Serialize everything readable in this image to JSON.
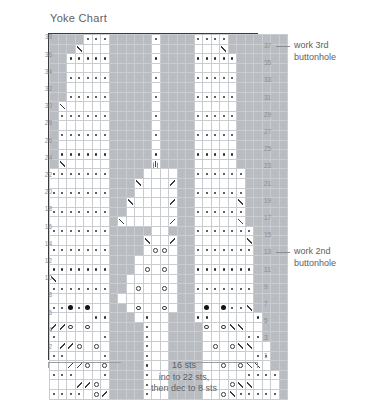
{
  "title": "Yoke Chart",
  "colors": {
    "cell_gray": "#b9bcc0",
    "cell_white": "#ffffff",
    "grid_line": "#c9ccd0",
    "border": "#3a3a3a",
    "text": "#5d6166",
    "label": "#8b8f94",
    "symbol": "#2b2b2b"
  },
  "grid": {
    "columns": 28,
    "rows": 38,
    "left_labels": [
      38,
      36,
      34,
      32,
      30,
      28,
      26,
      24,
      22,
      20,
      18,
      16,
      14,
      12,
      10,
      8,
      6,
      4,
      2
    ],
    "right_labels": [
      37,
      35,
      33,
      31,
      29,
      27,
      25,
      23,
      21,
      19,
      17,
      15,
      13,
      11,
      9,
      7,
      5,
      3,
      1
    ]
  },
  "annotations": [
    {
      "id": "anno-row-37",
      "row": 37,
      "line1": "work 3rd",
      "line2": "buttonhole"
    },
    {
      "id": "anno-row-13",
      "row": 13,
      "line1": "work 2nd",
      "line2": "buttonhole"
    }
  ],
  "caption": {
    "line1": "16 sts",
    "line2": "inc to 22 sts,",
    "line3": "then dec to 8 sts"
  },
  "legend_symbols": {
    "dot": "purl-dot",
    "bobble": "filled-bobble",
    "yo": "yarn-over-circle",
    "k2tog": "k2tog-right-slant",
    "ssk": "ssk-left-slant",
    "cdd": "centered-double-decrease",
    "bar": "horizontal-bar"
  },
  "chart_data": {
    "type": "heatmap",
    "title": "Yoke Chart",
    "xlabel": "",
    "ylabel": "",
    "columns": 28,
    "rows": 38,
    "legend": [
      "gray = background stitch",
      "white = contrast stitch"
    ],
    "cell_codes": "g=gray w=white; symbol suffix: .d dot, .b bobble, .o yarnover, .k k2tog, .s ssk, .c cdd, .h bar",
    "matrix": [
      [
        "g",
        "g",
        "g",
        "g",
        "w.d",
        "w.d",
        "w.d",
        "g",
        "g",
        "g",
        "g",
        "g",
        "w.d",
        "g",
        "g",
        "g",
        "g",
        "w.d",
        "w.d",
        "w.d",
        "w.d",
        "g",
        "g",
        "g",
        "g",
        "g",
        "g",
        "g"
      ],
      [
        "g",
        "g",
        "g",
        "w.k",
        "w",
        "w",
        "w",
        "g",
        "g",
        "g",
        "g",
        "g",
        "w",
        "g",
        "g",
        "g",
        "g",
        "w",
        "w",
        "w",
        "w.k",
        "g",
        "g",
        "g",
        "g",
        "g",
        "g",
        "g"
      ],
      [
        "g",
        "g",
        "w.d",
        "w.d",
        "w.d",
        "w.d",
        "w.d",
        "g",
        "g",
        "g",
        "g",
        "g",
        "w.d",
        "g",
        "g",
        "g",
        "g",
        "w.d",
        "w.d",
        "w.d",
        "w.d",
        "w.d",
        "g",
        "g",
        "g",
        "g",
        "g",
        "g"
      ],
      [
        "g",
        "g",
        "w",
        "w",
        "w",
        "w",
        "w",
        "g",
        "g",
        "g",
        "g",
        "g",
        "w",
        "g",
        "g",
        "g",
        "g",
        "w",
        "w",
        "w",
        "w",
        "w",
        "g",
        "g",
        "g",
        "g",
        "g",
        "g"
      ],
      [
        "g",
        "g",
        "w.d",
        "w.d",
        "w.d",
        "w.d",
        "w.d",
        "g",
        "g",
        "g",
        "g",
        "g",
        "w.d",
        "g",
        "g",
        "g",
        "g",
        "w.d",
        "w.d",
        "w.d",
        "w.d",
        "w.d",
        "g",
        "g",
        "g",
        "g",
        "g",
        "g"
      ],
      [
        "g",
        "g",
        "w",
        "w",
        "w",
        "w",
        "w",
        "g",
        "g",
        "g",
        "g",
        "g",
        "w",
        "g",
        "g",
        "g",
        "g",
        "w",
        "w",
        "w",
        "w",
        "w",
        "g",
        "g",
        "g",
        "g",
        "g",
        "g"
      ],
      [
        "g",
        "g",
        "w.d",
        "w.d",
        "w.d",
        "w.d",
        "w.d",
        "g",
        "g",
        "g",
        "g",
        "g",
        "w.d",
        "g",
        "g",
        "g",
        "g",
        "w.d",
        "w.d",
        "w.d",
        "w.d",
        "w.d",
        "g",
        "g",
        "g",
        "g",
        "g",
        "g"
      ],
      [
        "g",
        "w.k",
        "w",
        "w",
        "w",
        "w",
        "w",
        "g",
        "g",
        "g",
        "g",
        "g",
        "w",
        "g",
        "g",
        "g",
        "g",
        "w",
        "w",
        "w",
        "w",
        "w",
        "g",
        "g",
        "g",
        "g",
        "g",
        "g"
      ],
      [
        "g",
        "w.d",
        "w.d",
        "w.d",
        "w.d",
        "w.d",
        "w.d",
        "g",
        "g",
        "g",
        "g",
        "g",
        "w.d",
        "g",
        "g",
        "g",
        "g",
        "w.d",
        "w.d",
        "w.d",
        "w.d",
        "w.d",
        "g",
        "g",
        "g",
        "g",
        "g",
        "g"
      ],
      [
        "g",
        "w",
        "w",
        "w",
        "w",
        "w",
        "w",
        "g",
        "g",
        "g",
        "g",
        "g",
        "w",
        "g",
        "g",
        "g",
        "g",
        "w",
        "w",
        "w",
        "w",
        "w",
        "g",
        "g",
        "g",
        "g",
        "g",
        "g"
      ],
      [
        "g",
        "w.d",
        "w.d",
        "w.d",
        "w.d",
        "w.d",
        "w.d",
        "g",
        "g",
        "g",
        "g",
        "g",
        "w.d",
        "g",
        "g",
        "g",
        "g",
        "w.d",
        "w.d",
        "w.d",
        "w.d",
        "w.d",
        "g",
        "g",
        "g",
        "g",
        "g",
        "g"
      ],
      [
        "g",
        "w",
        "w",
        "w",
        "w",
        "w",
        "w",
        "g",
        "g",
        "g",
        "g",
        "g",
        "w",
        "g",
        "g",
        "g",
        "g",
        "w",
        "w",
        "w",
        "w",
        "w",
        "g",
        "g",
        "g",
        "g",
        "g",
        "g"
      ],
      [
        "g",
        "w.d",
        "w.d",
        "w.d",
        "w.d",
        "w.d",
        "w.d",
        "g",
        "g",
        "g",
        "g",
        "g",
        "w.d",
        "g",
        "g",
        "g",
        "g",
        "w.d",
        "w.d",
        "w.d",
        "w.d",
        "w.d",
        "g",
        "g",
        "g",
        "g",
        "g",
        "g"
      ],
      [
        "g",
        "w.k",
        "w",
        "w",
        "w",
        "w",
        "w",
        "g",
        "g",
        "g",
        "g",
        "g",
        "w.c",
        "g",
        "g",
        "g",
        "g",
        "w",
        "w",
        "w",
        "w",
        "w",
        "g",
        "g",
        "g",
        "g",
        "g",
        "g"
      ],
      [
        "w.d",
        "w.d",
        "w.d",
        "w.d",
        "w.d",
        "w.d",
        "w.d",
        "g",
        "g",
        "g",
        "g",
        "w",
        "w",
        "w",
        "w",
        "g",
        "g",
        "w.d",
        "w.d",
        "w.d",
        "w.d",
        "w.d",
        "w.d",
        "g",
        "g",
        "g",
        "g",
        "g"
      ],
      [
        "w",
        "w",
        "w",
        "w",
        "w",
        "w",
        "w",
        "g",
        "g",
        "g",
        "w.k",
        "w",
        "w",
        "w",
        "w.s",
        "g",
        "g",
        "w",
        "w",
        "w",
        "w",
        "w",
        "w",
        "g",
        "g",
        "g",
        "g",
        "g"
      ],
      [
        "w.d",
        "w.d",
        "w.d",
        "w.d",
        "w.d",
        "w.d",
        "w.d",
        "g",
        "g",
        "g",
        "w",
        "w",
        "w",
        "w",
        "w",
        "g",
        "g",
        "w.d",
        "w.d",
        "w.d",
        "w.d",
        "w.d",
        "w.d",
        "g",
        "g",
        "g",
        "g",
        "g"
      ],
      [
        "w",
        "w",
        "w",
        "w",
        "w",
        "w",
        "w",
        "g",
        "g",
        "w.k",
        "w",
        "w",
        "w",
        "w",
        "w.s",
        "g",
        "g",
        "w",
        "w",
        "w",
        "w",
        "w",
        "w.k",
        "g",
        "g",
        "g",
        "g",
        "g"
      ],
      [
        "w.d",
        "w.d",
        "w.d",
        "w.d",
        "w.d",
        "w.d",
        "w.d",
        "g",
        "g",
        "w",
        "w",
        "w",
        "w",
        "w",
        "w",
        "g",
        "g",
        "w.d",
        "w.d",
        "w.d",
        "w.d",
        "w.d",
        "w.d",
        "g",
        "g",
        "g",
        "g",
        "g"
      ],
      [
        "w",
        "w",
        "w",
        "w",
        "w",
        "w",
        "w",
        "g",
        "w.k",
        "w",
        "w",
        "w",
        "w",
        "w",
        "w.s",
        "g",
        "g",
        "w",
        "w",
        "w",
        "w",
        "w",
        "w.k",
        "g",
        "g",
        "g",
        "g",
        "g"
      ],
      [
        "w.d",
        "w.d",
        "w.d",
        "w.d",
        "w.d",
        "w.d",
        "w.d",
        "g",
        "g",
        "g",
        "g",
        "g",
        "w",
        "w",
        "g",
        "g",
        "g",
        "w.d",
        "w.d",
        "w.d",
        "w.d",
        "w.d",
        "w.d",
        "w.d",
        "g",
        "g",
        "g",
        "g"
      ],
      [
        "w",
        "w",
        "w",
        "w",
        "w",
        "w",
        "w",
        "g",
        "g",
        "g",
        "g",
        "w.k",
        "w",
        "w",
        "w.s",
        "g",
        "g",
        "w",
        "w",
        "w",
        "w",
        "w",
        "w",
        "w.k",
        "g",
        "g",
        "g",
        "g"
      ],
      [
        "w.d",
        "w.d",
        "w.d",
        "w.d",
        "w.d",
        "w.d",
        "w.d",
        "g",
        "g",
        "g",
        "g",
        "w",
        "w.o",
        "w.o",
        "w",
        "g",
        "g",
        "w.d",
        "w.d",
        "w.d",
        "w.d",
        "w.d",
        "w.d",
        "w.d",
        "g",
        "g",
        "g",
        "g"
      ],
      [
        "w",
        "w",
        "w",
        "w",
        "w",
        "w",
        "w",
        "g",
        "g",
        "g",
        "w",
        "w",
        "w",
        "w",
        "w",
        "g",
        "g",
        "w",
        "w",
        "w",
        "w",
        "w",
        "w",
        "w",
        "g",
        "g",
        "g",
        "g"
      ],
      [
        "w.d",
        "w.d",
        "w.d",
        "w.d",
        "w.d",
        "w.d",
        "w.d",
        "g",
        "g",
        "g",
        "w",
        "w.o",
        "w",
        "w.o",
        "w",
        "g",
        "g",
        "w.d",
        "w.d",
        "w.d",
        "w.d",
        "w.d",
        "w.d",
        "w.d",
        "g",
        "g",
        "g",
        "g"
      ],
      [
        "w.k",
        "w",
        "w",
        "w",
        "w",
        "w",
        "w",
        "g",
        "g",
        "w",
        "w",
        "w",
        "w",
        "w",
        "w",
        "g",
        "g",
        "w",
        "w",
        "w",
        "w",
        "w",
        "w",
        "w",
        "g",
        "g",
        "g",
        "g"
      ],
      [
        "w.d",
        "w.d",
        "w.d",
        "w.d",
        "w.d",
        "w.d",
        "w.d",
        "g",
        "g",
        "w",
        "w.o",
        "w",
        "w",
        "w.o",
        "w",
        "g",
        "g",
        "w.d",
        "w.d",
        "w.d",
        "w.d",
        "w.d",
        "w.d",
        "w.d",
        "g",
        "g",
        "g",
        "g"
      ],
      [
        "w",
        "w",
        "w",
        "w",
        "w",
        "w",
        "w",
        "g",
        "w",
        "w",
        "w",
        "w",
        "w",
        "w",
        "w",
        "g",
        "g",
        "w",
        "w",
        "w",
        "w",
        "w",
        "w",
        "w",
        "g",
        "g",
        "g",
        "g"
      ],
      [
        "w.d",
        "w.d",
        "w.b",
        "w.d",
        "w.b",
        "w",
        "w",
        "g",
        "g",
        "w",
        "w.o",
        "w",
        "w",
        "w.o",
        "w",
        "g",
        "g",
        "w",
        "w.b",
        "w",
        "w.b",
        "w.d",
        "w.d",
        "w.k",
        "g",
        "g",
        "g",
        "g"
      ],
      [
        "w",
        "w",
        "w",
        "w",
        "w",
        "w.d",
        "w.d",
        "g",
        "g",
        "g",
        "w",
        "w.d",
        "w",
        "w",
        "g",
        "g",
        "g",
        "w.d",
        "w.d",
        "w",
        "w",
        "w",
        "w",
        "w",
        "w.d",
        "g",
        "g",
        "g"
      ],
      [
        "w.s",
        "w.s",
        "w.o",
        "w",
        "w.o",
        "w",
        "w",
        "g",
        "g",
        "g",
        "g",
        "w.d",
        "w",
        "w",
        "g",
        "g",
        "g",
        "g",
        "w.o",
        "w",
        "w.o",
        "w.k",
        "w.k",
        "w",
        "w",
        "g",
        "g",
        "g"
      ],
      [
        "w.d",
        "w",
        "w",
        "w",
        "w",
        "w",
        "w.d",
        "g",
        "g",
        "g",
        "g",
        "w.d",
        "w",
        "w",
        "g",
        "g",
        "g",
        "g",
        "w",
        "w",
        "w",
        "w",
        "w",
        "w.d",
        "w.d",
        "g",
        "g",
        "g"
      ],
      [
        "w",
        "w.s",
        "w.s",
        "w.o",
        "w",
        "w.o",
        "w",
        "g",
        "g",
        "g",
        "g",
        "w.d",
        "w",
        "w",
        "g",
        "g",
        "g",
        "g",
        "w",
        "w.o",
        "w",
        "w.o",
        "w.k",
        "w.k",
        "w",
        "w",
        "g",
        "g"
      ],
      [
        "w.d",
        "w.d",
        "w",
        "w",
        "w",
        "w",
        "w.d",
        "g",
        "g",
        "g",
        "g",
        "w.d",
        "w",
        "w",
        "g",
        "g",
        "g",
        "g",
        "w",
        "w",
        "w",
        "w",
        "w",
        "w",
        "w.d",
        "w.d",
        "g",
        "g"
      ],
      [
        "w",
        "w",
        "w.s",
        "w.s",
        "w.o",
        "w",
        "w.o",
        "g",
        "g",
        "g",
        "g",
        "w.d",
        "w",
        "w",
        "g",
        "g",
        "g",
        "g",
        "w",
        "w",
        "w.o",
        "w",
        "w.o",
        "w.k",
        "w.k",
        "w",
        "g",
        "g"
      ],
      [
        "w.d",
        "w.d",
        "w.d",
        "w",
        "w",
        "w",
        "w.d",
        "g",
        "g",
        "g",
        "g",
        "w.d",
        "w",
        "w",
        "g",
        "g",
        "g",
        "g",
        "w",
        "w",
        "w",
        "w",
        "w",
        "w.d",
        "w.d",
        "w.d",
        "w.d",
        "g"
      ],
      [
        "w",
        "w",
        "w",
        "w.s",
        "w.s",
        "w.o",
        "w",
        "g",
        "g",
        "g",
        "g",
        "w.d",
        "w",
        "w",
        "g",
        "g",
        "g",
        "g",
        "w",
        "w",
        "w",
        "w.o",
        "w.k",
        "w.k",
        "w",
        "w",
        "w",
        "g"
      ],
      [
        "w.d",
        "w.d",
        "w.d",
        "w.d",
        "w",
        "w.o",
        "w.s",
        "g",
        "g",
        "g",
        "g",
        "w.d",
        "w",
        "w",
        "g",
        "g",
        "g",
        "g",
        "w",
        "w",
        "w.o",
        "w.k",
        "w.d",
        "w.d",
        "w.d",
        "w.d",
        "w.d",
        "g"
      ]
    ]
  }
}
